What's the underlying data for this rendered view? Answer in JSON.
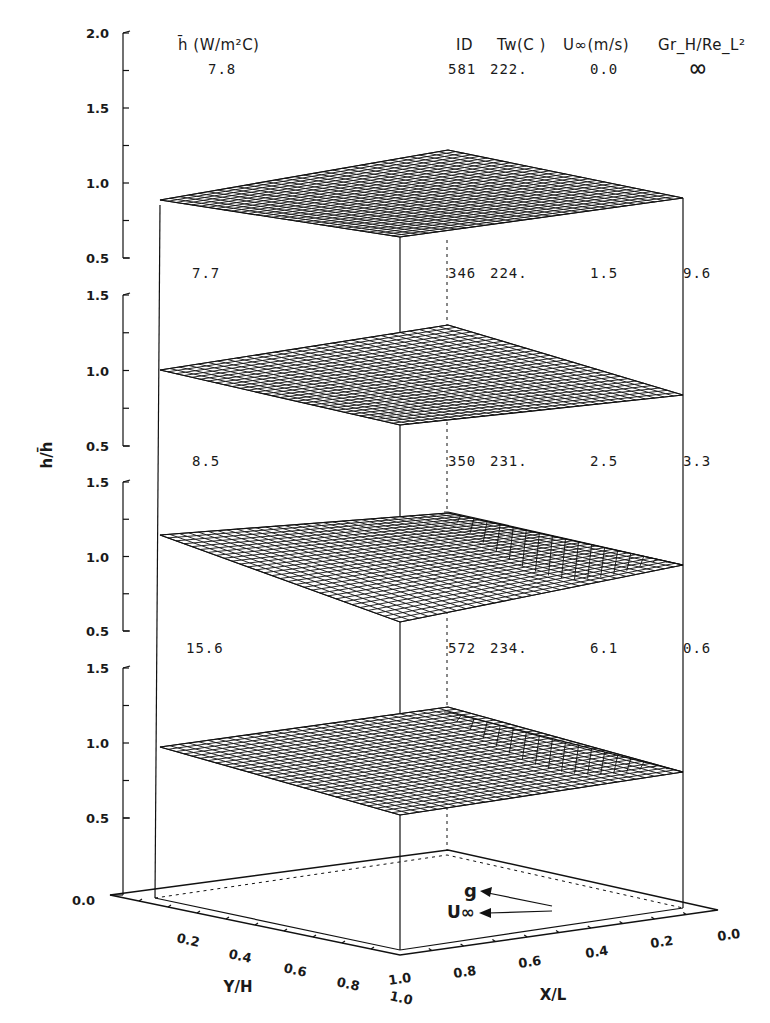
{
  "chart_data": {
    "type": "surface3d",
    "title": "",
    "zlabel": "h/h̄",
    "xlabel": "X/L",
    "ylabel": "Y/H",
    "x_ticks": [
      "1.0",
      "0.8",
      "0.6",
      "0.4",
      "0.2",
      "0.0"
    ],
    "y_ticks": [
      "0.2",
      "0.4",
      "0.6",
      "0.8",
      "1.0"
    ],
    "base_tick": "0.0",
    "header": {
      "hbar_label": "h̄ (W/m²C)",
      "id_label": "ID",
      "tw_label": "Tw(C )",
      "u_label": "U∞(m/s)",
      "gr_label": "Gr_H/Re_L²"
    },
    "panels": [
      {
        "z_ticks": [
          "2.0",
          "1.5",
          "1.0",
          "0.5"
        ],
        "zlim": [
          0.5,
          2.0
        ],
        "hbar": "7.8",
        "id": "581",
        "tw": "222.",
        "u_inf": "0.0",
        "gr_re2": "∞",
        "surface_profile": {
          "left_edge": 0.85,
          "center": 1.02,
          "leading_peak": 1.05,
          "trailing_edge": 0.98
        }
      },
      {
        "z_ticks": [
          "1.5",
          "1.0",
          "0.5"
        ],
        "zlim": [
          0.5,
          1.5
        ],
        "hbar": "7.7",
        "id": "346",
        "tw": "224.",
        "u_inf": "1.5",
        "gr_re2": "9.6",
        "surface_profile": {
          "left_edge": 1.0,
          "center": 1.0,
          "leading_peak": 1.25,
          "trailing_edge": 0.98
        }
      },
      {
        "z_ticks": [
          "1.5",
          "1.0",
          "0.5"
        ],
        "zlim": [
          0.5,
          1.5
        ],
        "hbar": "8.5",
        "id": "350",
        "tw": "231.",
        "u_inf": "2.5",
        "gr_re2": "3.3",
        "surface_profile": {
          "left_edge": 1.13,
          "center": 0.95,
          "leading_peak": 1.45,
          "trailing_edge": 0.75
        }
      },
      {
        "z_ticks": [
          "1.5",
          "1.0",
          "0.5"
        ],
        "zlim": [
          0.5,
          1.5
        ],
        "hbar": "15.6",
        "id": "572",
        "tw": "234.",
        "u_inf": "6.1",
        "gr_re2": "0.6",
        "surface_profile": {
          "left_edge": 0.97,
          "center": 1.0,
          "leading_peak": 1.1,
          "trailing_edge": 0.55
        }
      }
    ],
    "legend_arrows": [
      {
        "label": "g",
        "direction": "toward X/L=1.0"
      },
      {
        "label": "U∞",
        "direction": "toward X/L=1.0"
      }
    ]
  }
}
